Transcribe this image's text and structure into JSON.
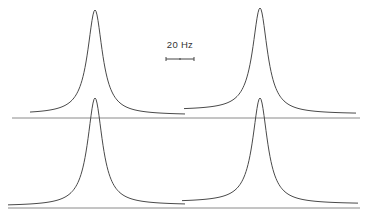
{
  "figure": {
    "scale_bar": {
      "label": "20 Hz"
    },
    "panels": [
      {
        "id": "top-left",
        "peak_x": 95,
        "peak_y": 10,
        "baseline_y": 118,
        "x_start": 30,
        "x_end": 185,
        "left_tail_y": 114,
        "right_tail_y": 115
      },
      {
        "id": "top-right",
        "peak_x": 260,
        "peak_y": 8,
        "baseline_y": 118,
        "x_start": 184,
        "x_end": 356,
        "left_tail_y": 110,
        "right_tail_y": 114
      },
      {
        "id": "bottom-left",
        "peak_x": 95,
        "peak_y": 98,
        "baseline_y": 208,
        "x_start": 8,
        "x_end": 185,
        "left_tail_y": 206,
        "right_tail_y": 205
      },
      {
        "id": "bottom-right",
        "peak_x": 260,
        "peak_y": 98,
        "baseline_y": 208,
        "x_start": 182,
        "x_end": 358,
        "left_tail_y": 202,
        "right_tail_y": 204
      }
    ]
  }
}
